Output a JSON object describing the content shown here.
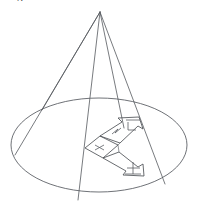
{
  "figure": {
    "background_color": "#ffffff",
    "line_color": "#55595e",
    "width": 199,
    "height": 206,
    "caption_fragment": "g",
    "apex": {
      "label": "apex",
      "x": 100,
      "y": 12
    },
    "base_ellipse": {
      "label": "base-ellipse",
      "cx": 99,
      "cy": 145,
      "rx": 88,
      "ry": 47
    },
    "generator_lines": [
      {
        "label": "generator-left-outer",
        "x1": 100,
        "y1": 12,
        "x2": 15,
        "y2": 155
      },
      {
        "label": "generator-left-inner",
        "x1": 100,
        "y1": 12,
        "x2": 42,
        "y2": 110
      },
      {
        "label": "generator-center",
        "x1": 100,
        "y1": 12,
        "x2": 78,
        "y2": 200
      },
      {
        "label": "generator-right-inner",
        "x1": 100,
        "y1": 12,
        "x2": 124,
        "y2": 128
      },
      {
        "label": "generator-right-outer",
        "x1": 100,
        "y1": 12,
        "x2": 165,
        "y2": 184
      }
    ],
    "inscribed_figure": {
      "label": "parallelogram-with-arrows",
      "vertices_note": "planar quadrilateral on base plane with two block arrows",
      "arrow_upper": {
        "label": "arrow-upper-right",
        "direction": "upper-right"
      },
      "arrow_lower": {
        "label": "arrow-lower-right",
        "direction": "lower-right"
      },
      "marks": [
        {
          "label": "cross-mark-left",
          "glyph": "x"
        },
        {
          "label": "tick-mark-upper",
          "glyph": "perpendicular"
        },
        {
          "label": "tick-mark-lower",
          "glyph": "plus"
        },
        {
          "label": "tick-mark-mid",
          "glyph": "zigzag"
        }
      ]
    }
  }
}
